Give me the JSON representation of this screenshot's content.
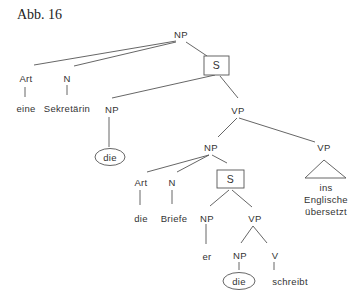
{
  "caption": "Abb. 16",
  "tree": {
    "root": {
      "label": "NP"
    },
    "art1": {
      "label": "Art"
    },
    "n1": {
      "label": "N"
    },
    "eine": {
      "label": "eine"
    },
    "sekretaerin": {
      "label": "Sekretärin"
    },
    "s1": {
      "label": "S",
      "boxed": true
    },
    "np_rel1": {
      "label": "NP"
    },
    "die_rel1": {
      "label": "die",
      "circled": true
    },
    "vp1": {
      "label": "VP"
    },
    "np2": {
      "label": "NP"
    },
    "vp2": {
      "label": "VP"
    },
    "vp2_leaf": {
      "lines": [
        "ins",
        "Englische",
        "übersetzt"
      ],
      "triangle": true
    },
    "art2": {
      "label": "Art"
    },
    "n2": {
      "label": "N"
    },
    "s2": {
      "label": "S",
      "boxed": true
    },
    "die2": {
      "label": "die"
    },
    "briefe": {
      "label": "Briefe"
    },
    "np_er": {
      "label": "NP"
    },
    "er": {
      "label": "er"
    },
    "vp3": {
      "label": "VP"
    },
    "np_rel2": {
      "label": "NP"
    },
    "die_rel2": {
      "label": "die",
      "circled": true
    },
    "v": {
      "label": "V"
    },
    "schreibt": {
      "label": "schreibt"
    }
  }
}
